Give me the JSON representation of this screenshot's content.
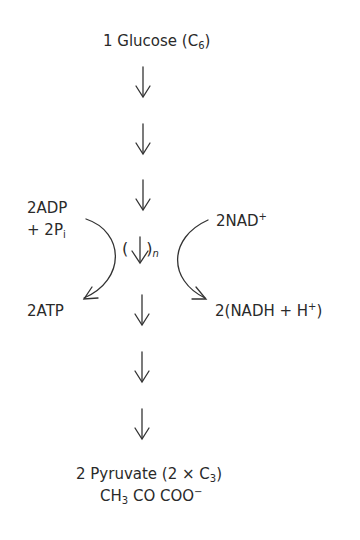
{
  "title": {
    "prefix": "1 Glucose (C",
    "sub": "6",
    "suffix": ")"
  },
  "left_input": {
    "line1": "2ADP",
    "line2_prefix": "+ 2P",
    "line2_sub": "i"
  },
  "left_output": {
    "label": "2ATP"
  },
  "right_input": {
    "prefix": "2NAD",
    "sup": "+"
  },
  "right_output": {
    "prefix": "2(NADH + H",
    "sup": "+",
    "suffix": ")"
  },
  "middle_step": {
    "open": "(",
    "arrow": "↓",
    "close": ")",
    "sub": "n"
  },
  "product": {
    "line1_prefix": "2 Pyruvate (2 × C",
    "line1_sub": "3",
    "line1_suffix": ")",
    "line2_a": "CH",
    "line2_a_sub": "3",
    "line2_b": " CO COO",
    "line2_b_sup": "−"
  },
  "arrows_count": 6,
  "colors": {
    "stroke": "#333333",
    "text": "#2a2a2a"
  }
}
